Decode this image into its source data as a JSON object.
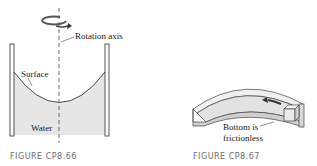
{
  "figure_left": {
    "caption": "FIGURE CP8.66",
    "labels": {
      "rotation_axis": "Rotation axis",
      "surface": "Surface",
      "water": "Water"
    }
  },
  "figure_right": {
    "caption": "FIGURE CP8.67",
    "labels": {
      "bottom_line1": "Bottom is",
      "bottom_line2": "frictionless"
    }
  },
  "colors": {
    "stroke": "#333333",
    "water_fill": "#e4e4e4",
    "channel_fill": "#ececec",
    "caption": "#6b6b6b"
  }
}
